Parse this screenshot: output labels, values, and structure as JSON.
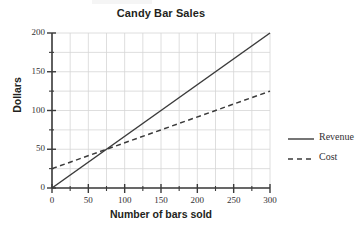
{
  "chart_data": {
    "type": "line",
    "title": "Candy Bar Sales",
    "xlabel": "Number of bars sold",
    "ylabel": "Dollars",
    "xlim": [
      0,
      300
    ],
    "ylim": [
      0,
      200
    ],
    "grid": true,
    "x_major_ticks": [
      0,
      50,
      100,
      150,
      200,
      250,
      300
    ],
    "x_minor_step": 25,
    "y_major_ticks": [
      0,
      50,
      100,
      150,
      200
    ],
    "y_minor_step": 25,
    "x_tick_labels": [
      "0",
      "50",
      "100",
      "150",
      "200",
      "250",
      "300"
    ],
    "y_tick_labels": [
      "0",
      "50",
      "100",
      "150",
      "200"
    ],
    "legend_position": "right",
    "series": [
      {
        "name": "Revenue",
        "style": "solid",
        "color": "#3b3b3b",
        "x": [
          0,
          300
        ],
        "values": [
          0,
          200
        ]
      },
      {
        "name": "Cost",
        "style": "dashed",
        "color": "#3b3b3b",
        "x": [
          0,
          300
        ],
        "values": [
          25,
          125
        ]
      }
    ],
    "intersection": {
      "x": 75,
      "y": 50
    }
  },
  "legend": {
    "items": [
      {
        "label": "Revenue"
      },
      {
        "label": "Cost"
      }
    ]
  },
  "colors": {
    "grid": "#d6d6d6",
    "axis": "#3b3b3b",
    "text": "#231f20",
    "background": "#ffffff"
  }
}
